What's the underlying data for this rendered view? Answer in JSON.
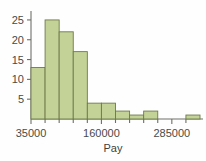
{
  "chart_data": {
    "type": "bar",
    "title": "",
    "subtitle": "",
    "xlabel": "Pay",
    "ylabel": "",
    "grid": false,
    "legend": false,
    "legend_position": "none",
    "bin_width": 25000,
    "bin_starts": [
      35000,
      60000,
      85000,
      110000,
      135000,
      160000,
      185000,
      210000,
      235000,
      260000,
      285000,
      310000
    ],
    "categories": [
      "35000-60000",
      "60000-85000",
      "85000-110000",
      "110000-135000",
      "135000-160000",
      "160000-185000",
      "185000-210000",
      "210000-235000",
      "235000-260000",
      "260000-285000",
      "285000-310000",
      "310000-335000"
    ],
    "values": [
      13,
      25,
      22,
      17,
      4,
      4,
      2,
      1,
      2,
      0,
      0,
      1
    ],
    "xlim": [
      35000,
      335000
    ],
    "ylim": [
      0,
      27
    ],
    "x_ticks": [
      35000,
      160000,
      285000
    ],
    "x_tick_labels": [
      "35000",
      "160000",
      "285000"
    ],
    "x_minor_ticks": [
      60000,
      85000,
      110000,
      135000,
      185000,
      210000,
      235000,
      260000,
      310000
    ],
    "y_ticks": [
      5,
      10,
      15,
      20,
      25
    ],
    "y_tick_labels": [
      "5",
      "10",
      "15",
      "20",
      "25"
    ],
    "colors": {
      "bar_fill": "#c3d397",
      "bar_stroke": "#6e7a4a",
      "axis": "#6f6f68",
      "text": "#4a4a46",
      "background": "#fefefe"
    }
  }
}
